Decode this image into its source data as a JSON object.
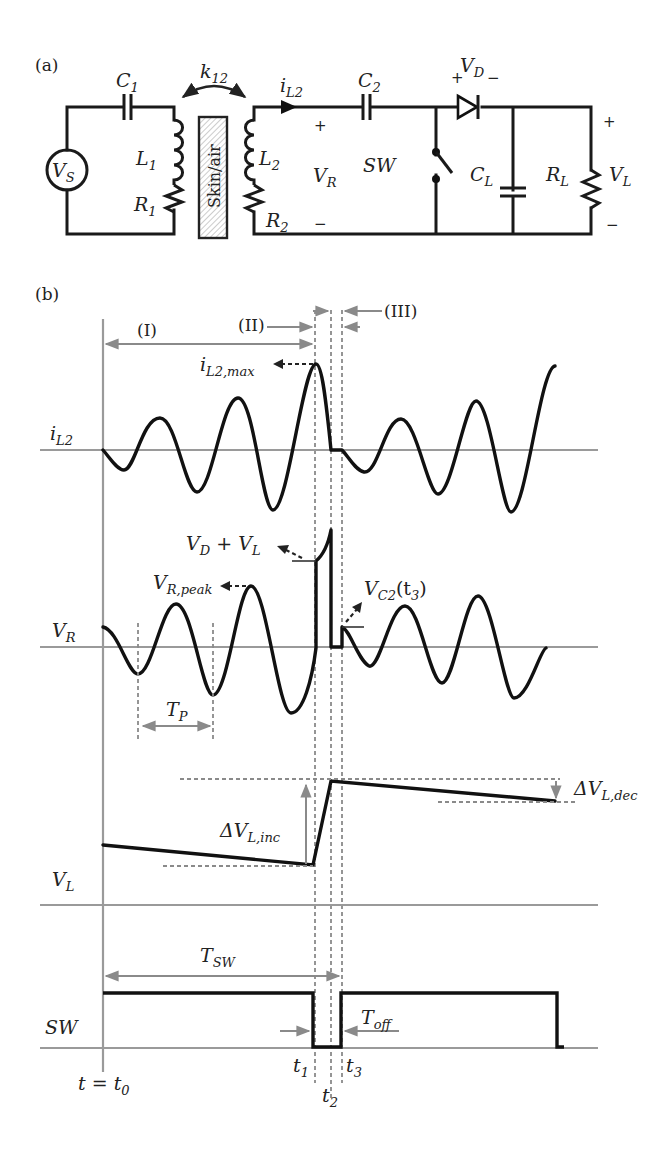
{
  "figure": {
    "panel_a_label": "(a)",
    "panel_b_label": "(b)"
  },
  "circuit": {
    "source": {
      "main": "V",
      "sub": "S"
    },
    "C1": {
      "main": "C",
      "sub": "1"
    },
    "L1": {
      "main": "L",
      "sub": "1"
    },
    "R1": {
      "main": "R",
      "sub": "1"
    },
    "coupling": {
      "main": "k",
      "sub": "12"
    },
    "barrier": "Skin/air",
    "L2": {
      "main": "L",
      "sub": "2"
    },
    "R2": {
      "main": "R",
      "sub": "2"
    },
    "iL2": {
      "main": "i",
      "sub": "L2"
    },
    "VR": {
      "main": "V",
      "sub": "R",
      "plus": "+",
      "minus": "−"
    },
    "C2": {
      "main": "C",
      "sub": "2"
    },
    "switch": "SW",
    "diode": {
      "main": "V",
      "sub": "D",
      "plus": "+",
      "minus": "−"
    },
    "CL": {
      "main": "C",
      "sub": "L"
    },
    "RL": {
      "main": "R",
      "sub": "L"
    },
    "VL": {
      "main": "V",
      "sub": "L",
      "plus": "+",
      "minus": "−"
    }
  },
  "timing": {
    "intervals": [
      "(I)",
      "(II)",
      "(III)"
    ],
    "traces": [
      {
        "main": "i",
        "sub": "L2"
      },
      {
        "main": "V",
        "sub": "R"
      },
      {
        "main": "V",
        "sub": "L"
      },
      {
        "main": "SW",
        "sub": ""
      }
    ],
    "annotations": {
      "iL2_max": {
        "main": "i",
        "sub": "L2,max"
      },
      "VD_plus_VL": {
        "a": "V",
        "asub": "D",
        "op": " + ",
        "b": "V",
        "bsub": "L"
      },
      "VR_peak": {
        "main": "V",
        "sub": "R,peak"
      },
      "VC2_t3": {
        "main": "V",
        "sub": "C2",
        "arg": "(t",
        "argsub": "3",
        "close": ")"
      },
      "Tp": {
        "main": "T",
        "sub": "P"
      },
      "dVL_inc": {
        "main": "ΔV",
        "sub": "L,inc"
      },
      "dVL_dec": {
        "main": "ΔV",
        "sub": "L,dec"
      },
      "Tsw": {
        "main": "T",
        "sub": "SW"
      },
      "Toff": {
        "main": "T",
        "sub": "off"
      }
    },
    "time_markers": {
      "t0": {
        "prefix": "t = t",
        "sub": "0"
      },
      "t1": {
        "main": "t",
        "sub": "1"
      },
      "t2": {
        "main": "t",
        "sub": "2"
      },
      "t3": {
        "main": "t",
        "sub": "3"
      }
    }
  }
}
